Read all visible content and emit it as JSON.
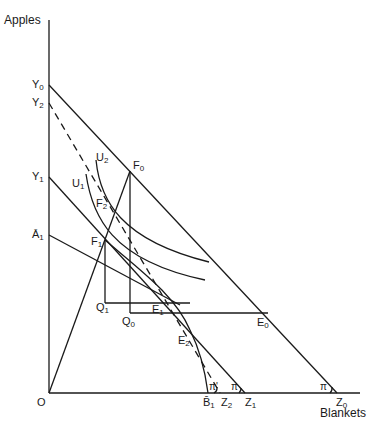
{
  "axes": {
    "y_label": "Apples",
    "x_label": "Blankets",
    "origin": "O"
  },
  "y_intercepts": [
    {
      "id": "Y0",
      "base": "Y",
      "sub": "0"
    },
    {
      "id": "Y2",
      "base": "Y",
      "sub": "2"
    },
    {
      "id": "Y1",
      "base": "Y",
      "sub": "1"
    },
    {
      "id": "A1",
      "base": "Ā",
      "sub": "1"
    }
  ],
  "x_intercepts": [
    {
      "id": "B1",
      "base": "B̄",
      "sub": "1"
    },
    {
      "id": "Z2",
      "base": "Z",
      "sub": "2"
    },
    {
      "id": "Z1",
      "base": "Z",
      "sub": "1"
    },
    {
      "id": "Z0",
      "base": "Z",
      "sub": "0"
    }
  ],
  "points": {
    "F0": {
      "base": "F",
      "sub": "0"
    },
    "F1": {
      "base": "F",
      "sub": "1"
    },
    "F2": {
      "base": "F",
      "sub": "2"
    },
    "U1": {
      "base": "U",
      "sub": "1"
    },
    "U2": {
      "base": "U",
      "sub": "2"
    },
    "Q0": {
      "base": "Q",
      "sub": "0"
    },
    "Q1": {
      "base": "Q",
      "sub": "1"
    },
    "E0": {
      "base": "E",
      "sub": "0"
    },
    "E1": {
      "base": "E",
      "sub": "1"
    },
    "E2": {
      "base": "E",
      "sub": "2"
    }
  },
  "angles": {
    "pi_prime": "π'",
    "pi1": "π",
    "pi0": "π"
  }
}
